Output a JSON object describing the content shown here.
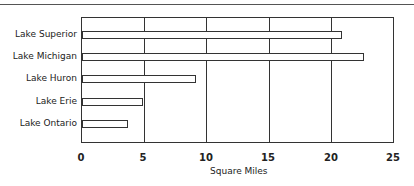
{
  "chart_data": {
    "type": "bar",
    "orientation": "horizontal",
    "title": "",
    "categories": [
      "Lake Superior",
      "Lake Michigan",
      "Lake Huron",
      "Lake Erie",
      "Lake Ontario"
    ],
    "values": [
      20.8,
      22.5,
      9.1,
      4.9,
      3.7
    ],
    "xlabel": "Square Miles",
    "ylabel": "",
    "xlim": [
      0,
      25
    ],
    "xticks": [
      "0",
      "5",
      "10",
      "15",
      "20",
      "25"
    ],
    "grid": true,
    "legend": null
  }
}
